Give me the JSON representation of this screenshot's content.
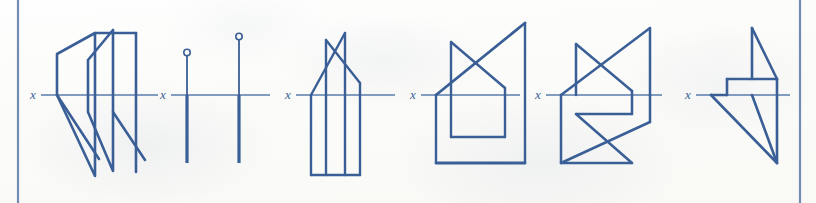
{
  "page": {
    "background_color": "#fdfdfb",
    "ink_color": "#3a5f96",
    "thin_ink_color": "#5a7cac",
    "border_color": "#5b7aa8",
    "width": 816,
    "height": 203
  },
  "borders": {
    "left_rule": {
      "x": 18,
      "y1": 0,
      "y2": 203
    },
    "right_rule": {
      "x": 800,
      "y1": 0,
      "y2": 203
    }
  },
  "figures": [
    {
      "id": "figure-1",
      "label": "x",
      "label_pos": {
        "x": 33,
        "y": 96
      },
      "axis": {
        "x1": 41,
        "y": 95,
        "x2": 158
      },
      "description": "Two overlapping chevron / bent-plane shapes",
      "polylines": [
        {
          "name": "outer-chevron",
          "points": "57,54 95,33 95,176 57,95 57,54"
        },
        {
          "name": "inner-chevron-upper",
          "points": "88,60 113,30 113,171 88,112 88,60"
        },
        {
          "name": "lower-wing-left",
          "points": "57,95 99,159"
        },
        {
          "name": "lower-wing-right",
          "points": "113,95 145,160"
        },
        {
          "name": "top-bar-outer",
          "points": "95,33 136,33"
        },
        {
          "name": "right-edge",
          "points": "136,33 136,172"
        },
        {
          "name": "lower-diagonal-right",
          "points": "113,112 136,145"
        }
      ]
    },
    {
      "id": "figure-2",
      "label": "x",
      "label_pos": {
        "x": 163,
        "y": 96
      },
      "axis": {
        "x1": 171,
        "y": 95,
        "x2": 270
      },
      "description": "Two vertical edge-view lines with circle end markers above the axis",
      "verticals": [
        {
          "name": "left-vertical",
          "x": 187,
          "top": 53,
          "bottom": 163,
          "circle_r": 3.2,
          "circle_cy": 53
        },
        {
          "name": "right-vertical",
          "x": 239,
          "top": 37,
          "bottom": 163,
          "circle_r": 3.2,
          "circle_cy": 37
        }
      ]
    },
    {
      "id": "figure-3",
      "label": "x",
      "label_pos": {
        "x": 288,
        "y": 96
      },
      "axis": {
        "x1": 296,
        "y": 95,
        "x2": 395
      },
      "description": "House-shaped plan with crossed diagonals above the axis and box below",
      "polylines": [
        {
          "name": "left-vertical-tall",
          "points": "326,40 326,175"
        },
        {
          "name": "right-vertical-tall",
          "points": "345,33 345,175"
        },
        {
          "name": "diagonal-a",
          "points": "326,40 360,83"
        },
        {
          "name": "diagonal-b",
          "points": "345,33 311,95"
        },
        {
          "name": "apex-slope",
          "points": "360,83 360,95"
        },
        {
          "name": "base-slope",
          "points": "311,95 345,33"
        },
        {
          "name": "box-left",
          "points": "311,95 311,175"
        },
        {
          "name": "box-bottom",
          "points": "311,175 345,175"
        },
        {
          "name": "box-inner-right",
          "points": "360,95 360,175"
        },
        {
          "name": "box-bottom-ext",
          "points": "345,175 360,175"
        }
      ]
    },
    {
      "id": "figure-4",
      "label": "x",
      "label_pos": {
        "x": 413,
        "y": 96
      },
      "axis": {
        "x1": 421,
        "y": 95,
        "x2": 520
      },
      "description": "House shape with long diagonal and inner rectangle below the axis",
      "polylines": [
        {
          "name": "left-vertical",
          "points": "451,42 451,137"
        },
        {
          "name": "right-vertical-tall",
          "points": "525,23 525,163"
        },
        {
          "name": "long-diagonal",
          "points": "436,95 525,23"
        },
        {
          "name": "short-diagonal",
          "points": "451,42 505,88"
        },
        {
          "name": "apex-right",
          "points": "505,88 505,137"
        },
        {
          "name": "outer-left",
          "points": "436,95 436,163"
        },
        {
          "name": "outer-bottom",
          "points": "436,163 525,163"
        },
        {
          "name": "inner-bottom",
          "points": "451,137 505,137"
        }
      ]
    },
    {
      "id": "figure-5",
      "label": "x",
      "label_pos": {
        "x": 538,
        "y": 96
      },
      "axis": {
        "x1": 546,
        "y": 95,
        "x2": 662
      },
      "description": "Symmetric double bow-tie / star, mirrored above and below the axis",
      "polylines": [
        {
          "name": "upper-left-vertical",
          "points": "576,44 576,95"
        },
        {
          "name": "upper-right-vertical",
          "points": "650,28 650,95"
        },
        {
          "name": "upper-diagonal-a",
          "points": "561,95 650,28"
        },
        {
          "name": "upper-diagonal-b",
          "points": "576,44 632,91"
        },
        {
          "name": "upper-apex-right",
          "points": "632,91 632,114"
        },
        {
          "name": "lower-left-vertical",
          "points": "561,95 561,163"
        },
        {
          "name": "lower-right-vertical",
          "points": "650,95 650,122"
        },
        {
          "name": "lower-diagonal-a",
          "points": "561,163 650,122"
        },
        {
          "name": "lower-diagonal-b",
          "points": "576,114 632,163"
        },
        {
          "name": "lower-bar",
          "points": "576,114 632,114"
        },
        {
          "name": "lower-bottom-bar",
          "points": "561,163 632,163"
        }
      ]
    },
    {
      "id": "figure-6",
      "label": "x",
      "label_pos": {
        "x": 688,
        "y": 96
      },
      "axis": {
        "x1": 696,
        "y": 95,
        "x2": 790
      },
      "description": "Thin horizontal band with triangular wings above and below",
      "polylines": [
        {
          "name": "band-top",
          "points": "727,79 777,79"
        },
        {
          "name": "band-left",
          "points": "727,79 727,95"
        },
        {
          "name": "band-bottom-left",
          "points": "711,95 727,95"
        },
        {
          "name": "upper-vertical",
          "points": "752,28 752,79"
        },
        {
          "name": "upper-diagonal",
          "points": "752,28 777,79"
        },
        {
          "name": "right-vertical",
          "points": "777,79 777,163"
        },
        {
          "name": "lower-diagonal-long",
          "points": "711,95 777,163"
        },
        {
          "name": "lower-diagonal-inner",
          "points": "752,95 777,163"
        }
      ]
    }
  ]
}
